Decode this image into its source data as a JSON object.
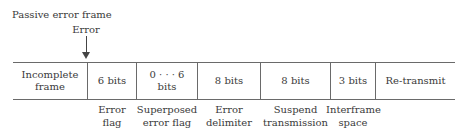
{
  "diagram": {
    "title": "Passive error frame",
    "error_marker": "Error",
    "fields": [
      {
        "content": "Incomplete\nframe",
        "label": ""
      },
      {
        "content": "6 bits",
        "label": "Error\nflag"
      },
      {
        "content": "0 · · · 6\nbits",
        "label": "Superposed\nerror flag"
      },
      {
        "content": "8 bits",
        "label": "Error\ndelimiter"
      },
      {
        "content": "8 bits",
        "label": "Suspend\ntransmission"
      },
      {
        "content": "3 bits",
        "label": "Interframe\nspace"
      },
      {
        "content": "Re-transmit",
        "label": ""
      }
    ]
  }
}
